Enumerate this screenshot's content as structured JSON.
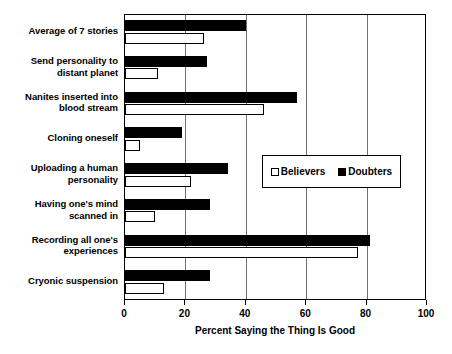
{
  "chart_data": {
    "type": "bar",
    "orientation": "horizontal",
    "title": "",
    "xlabel": "Percent Saying the Thing Is Good",
    "ylabel": "",
    "xlim": [
      0,
      100
    ],
    "xticks": [
      0,
      20,
      40,
      60,
      80,
      100
    ],
    "xtick_labels": [
      "0",
      "20",
      "40",
      "60",
      "80",
      "100"
    ],
    "grid": true,
    "legend_position": "center-right",
    "categories": [
      "Average of 7 stories",
      "Send personality to distant planet",
      "Nanites inserted into blood stream",
      "Cloning oneself",
      "Uploading a human personality",
      "Having one's mind scanned in",
      "Recording all one's experiences",
      "Cryonic suspension"
    ],
    "series": [
      {
        "name": "Believers",
        "color": "#ffffff",
        "edge_color": "#000000",
        "values": [
          26,
          11,
          46,
          5,
          22,
          10,
          77,
          13
        ]
      },
      {
        "name": "Doubters",
        "color": "#000000",
        "edge_color": "#000000",
        "values": [
          40,
          27,
          57,
          19,
          34,
          28,
          81,
          28
        ]
      }
    ]
  },
  "category_lines": [
    [
      "Average of 7 stories"
    ],
    [
      "Send personality to",
      "distant planet"
    ],
    [
      "Nanites inserted into",
      "blood stream"
    ],
    [
      "Cloning oneself"
    ],
    [
      "Uploading a human",
      "personality"
    ],
    [
      "Having one's mind",
      "scanned in"
    ],
    [
      "Recording all one's",
      "experiences"
    ],
    [
      "Cryonic suspension"
    ]
  ],
  "legend": {
    "believers_label": "Believers",
    "doubters_label": "Doubters"
  },
  "axis": {
    "x_title": "Percent Saying the Thing Is Good",
    "tick_0": "0",
    "tick_20": "20",
    "tick_40": "40",
    "tick_60": "60",
    "tick_80": "80",
    "tick_100": "100"
  }
}
